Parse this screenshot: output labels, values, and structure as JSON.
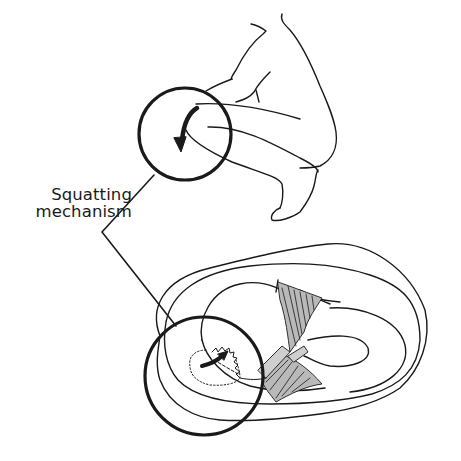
{
  "figure": {
    "label": {
      "line1": "Squatting",
      "line2": "mechanism"
    },
    "panels": [
      {
        "name": "squatting-figure",
        "description": "Person in deep squat with knee magnified by circle"
      },
      {
        "name": "tibial-plateau-view",
        "description": "Superior view of knee meniscus with magnified region showing tear"
      }
    ],
    "colors": {
      "ink": "#1a1a1a",
      "ligament_fill": "#b9b9b9",
      "background": "#ffffff"
    }
  }
}
